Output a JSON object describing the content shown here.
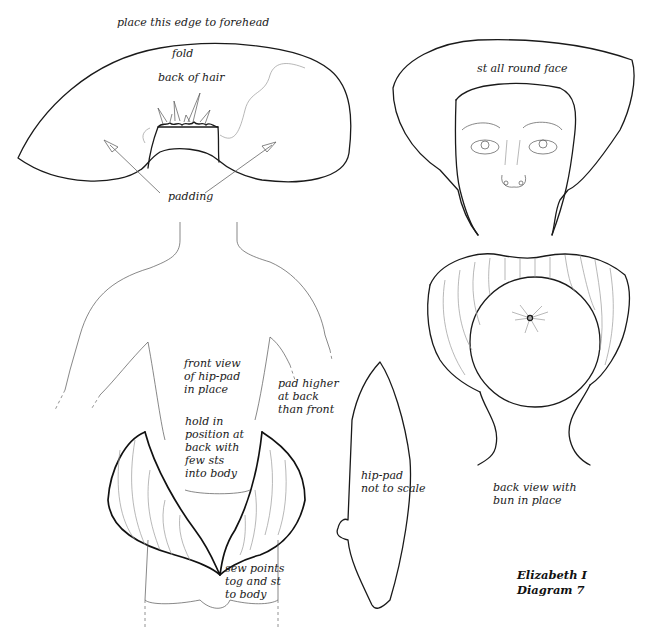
{
  "diagram": {
    "title": "Elizabeth I\nDiagram 7",
    "hair_piece": {
      "label_top": "place this edge to forehead",
      "label_fold": "fold",
      "label_back": "back of hair",
      "label_padding": "padding"
    },
    "face_view": {
      "label": "st all round face"
    },
    "back_view": {
      "label": "back view with\nbun in place"
    },
    "front_body": {
      "label_front": "front view\nof hip-pad\nin place",
      "label_hold": "hold in\nposition at\nback with\nfew sts\ninto body",
      "label_higher": "pad higher\nat back\nthan front",
      "label_sew": "sew points\ntog and st\nto body"
    },
    "hip_pad": {
      "label": "hip-pad\nnot to scale"
    },
    "colors": {
      "ink": "#1a1a1a",
      "paper": "#ffffff",
      "light_line": "#999999"
    }
  }
}
